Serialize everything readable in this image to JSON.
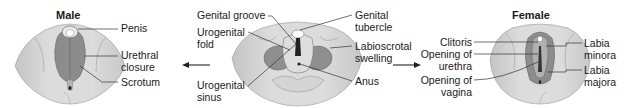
{
  "male": {
    "title": "Male",
    "labels": {
      "penis": "Penis",
      "urethral_line1": "Urethral",
      "urethral_line2": "closure",
      "scrotum": "Scrotum"
    }
  },
  "indifferent": {
    "labels": {
      "genital_groove": "Genital groove",
      "urogenital_fold_line1": "Urogenital",
      "urogenital_fold_line2": "fold",
      "urogenital_sinus_line1": "Urogenital",
      "urogenital_sinus_line2": "sinus",
      "genital_tubercle_line1": "Genital",
      "genital_tubercle_line2": "tubercle",
      "labioscrotal_line1": "Labioscrotal",
      "labioscrotal_line2": "swelling",
      "anus": "Anus"
    }
  },
  "female": {
    "title": "Female",
    "labels": {
      "clitoris": "Clitoris",
      "opening_urethra_line1": "Opening of",
      "opening_urethra_line2": "urethra",
      "opening_vagina_line1": "Opening of",
      "opening_vagina_line2": "vagina",
      "labia_minora_line1": "Labia",
      "labia_minora_line2": "minora",
      "labia_majora_line1": "Labia",
      "labia_majora_line2": "majora"
    }
  },
  "colors": {
    "skin_light": "#d9d9d9",
    "skin_mid": "#bdbdbd",
    "fold_dark": "#8a8a8a",
    "line": "#333333",
    "text": "#1a1a1a"
  },
  "arrows": [
    {
      "direction": "left",
      "label": "to-male"
    },
    {
      "direction": "right",
      "label": "to-female"
    }
  ]
}
